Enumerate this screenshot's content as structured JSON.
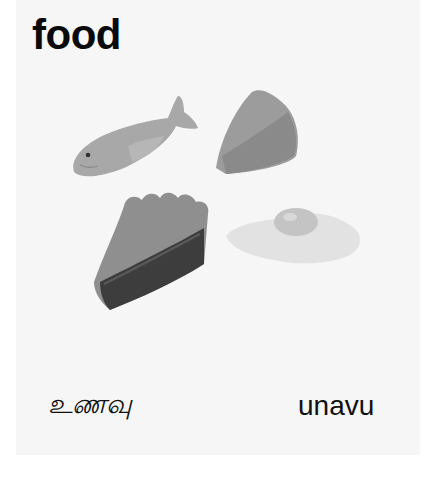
{
  "card": {
    "title": "food",
    "word_native": "உணவு",
    "word_transliteration": "unavu",
    "illustrations": [
      {
        "name": "fish",
        "icon": "fish-icon"
      },
      {
        "name": "cheese",
        "icon": "cheese-wedge-icon"
      },
      {
        "name": "pie slice",
        "icon": "pie-slice-icon"
      },
      {
        "name": "fried egg",
        "icon": "fried-egg-icon"
      }
    ],
    "colors": {
      "background": "#ffffff",
      "card": "#f6f6f6",
      "text": "#0a0a0a"
    }
  }
}
